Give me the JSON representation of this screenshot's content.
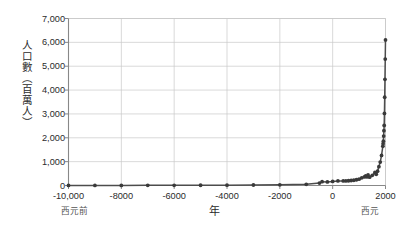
{
  "axes": {
    "y_title": "人口數（百萬人）",
    "x_title": "年",
    "era_left": "西元前",
    "era_right": "西元",
    "y_ticks": [
      "0",
      "1,000",
      "2,000",
      "3,000",
      "4,000",
      "5,000",
      "6,000",
      "7,000"
    ],
    "x_ticks": [
      "-10,000",
      "-8000",
      "-6000",
      "-4000",
      "-2000",
      "0",
      "2000"
    ]
  },
  "colors": {
    "line": "#4d4d4d",
    "marker": "#3a3a3a",
    "grid": "#c8c8c8",
    "axis": "#888888",
    "text": "#2b2b2b",
    "background": "#ffffff"
  },
  "chart_data": {
    "type": "line",
    "title": "",
    "subtitle": "",
    "xlabel": "年",
    "ylabel": "人口數（百萬人）",
    "xlim": [
      -10000,
      2000
    ],
    "ylim": [
      0,
      7000
    ],
    "xticks": [
      -10000,
      -8000,
      -6000,
      -4000,
      -2000,
      0,
      2000
    ],
    "xticklabels": [
      "-10,000",
      "-8000",
      "-6000",
      "-4000",
      "-2000",
      "0",
      "2000"
    ],
    "yticks": [
      0,
      1000,
      2000,
      3000,
      4000,
      5000,
      6000,
      7000
    ],
    "yticklabels": [
      "0",
      "1,000",
      "2,000",
      "3,000",
      "4,000",
      "5,000",
      "6,000",
      "7,000"
    ],
    "grid": true,
    "legend": false,
    "markers": true,
    "series": [
      {
        "name": "世界人口",
        "x": [
          -10000,
          -9000,
          -8000,
          -7000,
          -6000,
          -5000,
          -4000,
          -3000,
          -2000,
          -1000,
          -500,
          -400,
          -200,
          0,
          200,
          400,
          500,
          600,
          700,
          800,
          900,
          1000,
          1100,
          1200,
          1250,
          1300,
          1340,
          1400,
          1500,
          1600,
          1650,
          1700,
          1750,
          1800,
          1850,
          1900,
          1910,
          1920,
          1930,
          1940,
          1950,
          1960,
          1970,
          1980,
          1990,
          2000
        ],
        "y": [
          4,
          5,
          5,
          7,
          7,
          10,
          14,
          20,
          27,
          50,
          100,
          162,
          150,
          170,
          190,
          190,
          190,
          200,
          210,
          220,
          240,
          265,
          320,
          360,
          400,
          360,
          443,
          350,
          425,
          545,
          470,
          600,
          790,
          980,
          1260,
          1650,
          1750,
          1860,
          2070,
          2300,
          2520,
          3020,
          3700,
          4450,
          5300,
          6100
        ],
        "unit": "百萬人",
        "color": "#3a3a3a"
      }
    ],
    "notes": {
      "era_before": "西元前",
      "era_after": "西元",
      "peak_value": 6100,
      "peak_year": 2000,
      "shape": "hockey-stick / exponential growth"
    }
  }
}
